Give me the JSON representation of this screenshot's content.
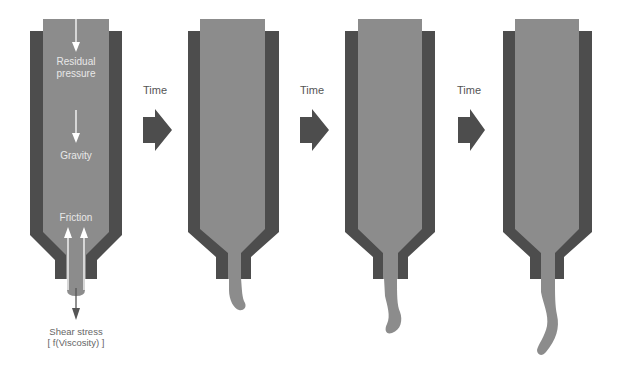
{
  "diagram": {
    "colors": {
      "barrel": "#4d4d4d",
      "material": "#8c8c8c",
      "force_arrow_inner": "#ffffff",
      "force_arrow_outer": "#555555",
      "time_arrow": "#4d4d4d",
      "time_text": "#555555",
      "caption_text": "#666666"
    },
    "forces": {
      "residual_pressure": "Residual\npressure",
      "residual_pressure_line1": "Residual",
      "residual_pressure_line2": "pressure",
      "gravity": "Gravity",
      "friction": "Friction",
      "shear_stress_line1": "Shear stress",
      "shear_stress_line2": "[ f(Viscosity) ]"
    },
    "transitions": [
      {
        "label": "Time"
      },
      {
        "label": "Time"
      },
      {
        "label": "Time"
      }
    ],
    "stages": [
      {
        "index": 1,
        "extrusion": "short, straight (with force annotations)"
      },
      {
        "index": 2,
        "extrusion": "short, curled tip"
      },
      {
        "index": 3,
        "extrusion": "medium, S-curve"
      },
      {
        "index": 4,
        "extrusion": "long, S-curve"
      }
    ]
  }
}
